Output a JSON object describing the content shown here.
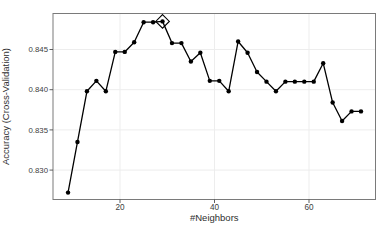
{
  "chart_data": {
    "type": "line",
    "title": "",
    "xlabel": "#Neighbors",
    "ylabel": "Accuracy (Cross-Validation)",
    "x": [
      9,
      11,
      13,
      15,
      17,
      19,
      21,
      23,
      25,
      27,
      29,
      31,
      33,
      35,
      37,
      39,
      41,
      43,
      45,
      47,
      49,
      51,
      53,
      55,
      57,
      59,
      61,
      63,
      65,
      67,
      69,
      71
    ],
    "series": [
      {
        "name": "Accuracy (Cross-Validation)",
        "values": [
          0.8272,
          0.8335,
          0.8398,
          0.8411,
          0.8398,
          0.8447,
          0.8447,
          0.8459,
          0.8484,
          0.8484,
          0.8485,
          0.8458,
          0.8458,
          0.8435,
          0.8446,
          0.8411,
          0.8411,
          0.8398,
          0.846,
          0.8446,
          0.8422,
          0.841,
          0.8398,
          0.841,
          0.841,
          0.841,
          0.841,
          0.8433,
          0.8384,
          0.8361,
          0.8373,
          0.8373
        ]
      }
    ],
    "best_point": {
      "x": 29,
      "y": 0.8485,
      "marker": "open-diamond"
    },
    "x_ticks": [
      20,
      40,
      60
    ],
    "y_ticks": [
      "0.830",
      "0.835",
      "0.840",
      "0.845"
    ],
    "xlim": [
      5.82,
      74.07
    ],
    "ylim": [
      0.82634,
      0.84948
    ],
    "grid": true,
    "legend": false,
    "marker": "filled-circle",
    "colors": {
      "line": "#000000",
      "marker": "#000000",
      "grid": "#ededed",
      "panel_border": "#7a7a7a",
      "tick": "#4d4d4d",
      "text": "#3d3d3d",
      "background": "#ffffff"
    }
  }
}
